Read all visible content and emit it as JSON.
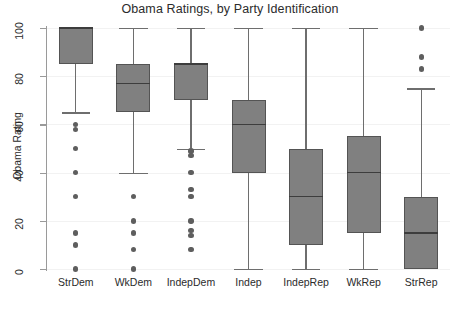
{
  "chart_data": {
    "type": "box",
    "title": "Obama Ratings, by Party Identification",
    "xlabel": "",
    "ylabel": "Obama Rating",
    "ylim": [
      0,
      100
    ],
    "yticks": [
      0,
      20,
      40,
      60,
      80,
      100
    ],
    "ytick_labels": [
      "0",
      "20",
      "40",
      "60",
      "80",
      "100"
    ],
    "grid": true,
    "legend": "none",
    "categories": [
      "StrDem",
      "WkDem",
      "IndepDem",
      "Indep",
      "IndepRep",
      "WkRep",
      "StrRep"
    ],
    "boxes": [
      {
        "category": "StrDem",
        "whisker_low": 65,
        "q1": 85,
        "median": 100,
        "q3": 100,
        "whisker_high": 100,
        "outliers": [
          60,
          58,
          50,
          40,
          30,
          15,
          10,
          0
        ]
      },
      {
        "category": "WkDem",
        "whisker_low": 40,
        "q1": 65,
        "median": 77,
        "q3": 85,
        "whisker_high": 100,
        "outliers": [
          30,
          20,
          15,
          8,
          0
        ]
      },
      {
        "category": "IndepDem",
        "whisker_low": 50,
        "q1": 70,
        "median": 85,
        "q3": 85,
        "whisker_high": 100,
        "outliers": [
          49,
          47,
          40,
          33,
          30,
          20,
          16,
          14,
          8
        ]
      },
      {
        "category": "Indep",
        "whisker_low": 0,
        "q1": 40,
        "median": 60,
        "q3": 70,
        "whisker_high": 100,
        "outliers": []
      },
      {
        "category": "IndepRep",
        "whisker_low": 0,
        "q1": 10,
        "median": 30,
        "q3": 50,
        "whisker_high": 100,
        "outliers": []
      },
      {
        "category": "WkRep",
        "whisker_low": 0,
        "q1": 15,
        "median": 40,
        "q3": 55,
        "whisker_high": 100,
        "outliers": []
      },
      {
        "category": "StrRep",
        "whisker_low": 0,
        "q1": 0,
        "median": 15,
        "q3": 30,
        "whisker_high": 75,
        "outliers": [
          100,
          88,
          83
        ]
      }
    ]
  },
  "colors": {
    "box_fill": "#808080",
    "box_edge": "#545454",
    "median": "#3d3d3d",
    "whisker": "#6e6e6e",
    "outlier": "#5e5e5e",
    "axis": "#9a9a9a",
    "grid": "#f2f2f2",
    "background": "#ffffff",
    "text": "#2b2b2b"
  }
}
